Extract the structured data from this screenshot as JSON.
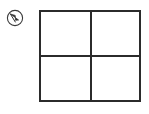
{
  "canvas": {
    "width": 149,
    "height": 114,
    "background_color": "#ffffff"
  },
  "marker": {
    "icon_name": "circled-arrow-icon",
    "shape": "circle",
    "inner_glyph": "diagonal-arrow-pointing-up-left",
    "stroke_color": "#3a3a3a",
    "fill_color": "#ffffff"
  },
  "grid": {
    "rows": 2,
    "columns": 2,
    "line_color": "#2b2b2b",
    "line_width": 2,
    "background_color": "#ffffff",
    "cells": [
      {
        "position": "top-left",
        "contents": "empty"
      },
      {
        "position": "top-right",
        "contents": "empty"
      },
      {
        "position": "bottom-left",
        "contents": "empty"
      },
      {
        "position": "bottom-right",
        "contents": "bird-figure"
      }
    ]
  },
  "figure": {
    "name": "bird-figure",
    "cell": "bottom-right",
    "fill_color": "#b3b3b3",
    "outline_color": "#1c1c1c",
    "wing_fill_color": "#b3b3b3",
    "parts": [
      "body",
      "head-protrusion-left",
      "wing-circle-right",
      "tail-point-right",
      "scalloped-lower-edge"
    ]
  }
}
